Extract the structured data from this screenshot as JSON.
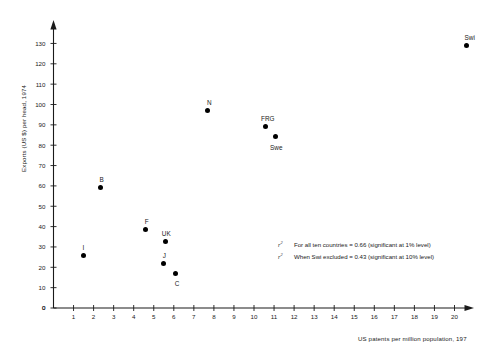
{
  "chart_data": {
    "type": "scatter",
    "title": "",
    "xlabel": "US patents per million population, 197",
    "ylabel": "Exports (US $) per head, 1974",
    "xlim": [
      0,
      21
    ],
    "ylim": [
      0,
      134
    ],
    "grid": false,
    "legend_position": "none",
    "xticks": [
      "0",
      "1",
      "2",
      "3",
      "4",
      "5",
      "6",
      "7",
      "8",
      "9",
      "10",
      "11",
      "12",
      "13",
      "14",
      "15",
      "16",
      "17",
      "18",
      "19",
      "20"
    ],
    "yticks": [
      "0",
      "10",
      "20",
      "30",
      "40",
      "50",
      "60",
      "70",
      "80",
      "90",
      "100",
      "110",
      "120",
      "130"
    ],
    "points": [
      {
        "label": "I",
        "x": 1.5,
        "y": 26.0,
        "label_dx": -1,
        "label_dy": -8
      },
      {
        "label": "B",
        "x": 2.35,
        "y": 59.0,
        "label_dx": -1,
        "label_dy": -8
      },
      {
        "label": "F",
        "x": 4.6,
        "y": 38.5,
        "label_dx": -1,
        "label_dy": -8
      },
      {
        "label": "UK",
        "x": 5.6,
        "y": 32.5,
        "label_dx": -4,
        "label_dy": -8
      },
      {
        "label": "J",
        "x": 5.5,
        "y": 22.0,
        "label_dx": -1,
        "label_dy": -8
      },
      {
        "label": "C",
        "x": 6.1,
        "y": 17.0,
        "label_dx": -1,
        "label_dy": 10
      },
      {
        "label": "N",
        "x": 7.7,
        "y": 97.0,
        "label_dx": -1,
        "label_dy": -8
      },
      {
        "label": "FRG",
        "x": 10.55,
        "y": 89.0,
        "label_dx": -4,
        "label_dy": -8
      },
      {
        "label": "Swe",
        "x": 11.05,
        "y": 84.5,
        "label_dx": -5,
        "label_dy": 11
      },
      {
        "label": "Swi",
        "x": 20.6,
        "y": 129.0,
        "label_dx": -2,
        "label_dy": -8
      }
    ],
    "annotations": [
      {
        "symbol": "r",
        "superscript": "2",
        "text": "For all ten countries = 0.66 (significant at 1% level)"
      },
      {
        "symbol": "r",
        "superscript": "2",
        "text": "When Swi excluded = 0.43 (significant at 10% level)"
      }
    ],
    "colors": {
      "point": "#000000",
      "axis": "#1a1a1a",
      "text": "#1a1a1a",
      "background": "#ffffff"
    }
  }
}
